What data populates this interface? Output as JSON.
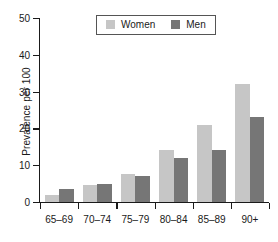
{
  "chart_data": {
    "type": "bar",
    "title": "",
    "subtitle": "",
    "xlabel": "",
    "ylabel": "Prevalence per 100",
    "categories": [
      "65–69",
      "70–74",
      "75–79",
      "80–84",
      "85–89",
      "90+"
    ],
    "series": [
      {
        "name": "Women",
        "color": "#c6c6c6",
        "values": [
          2,
          4.5,
          7.5,
          14,
          21,
          32
        ]
      },
      {
        "name": "Men",
        "color": "#767676",
        "values": [
          3.5,
          5,
          7,
          12,
          14,
          23
        ]
      }
    ],
    "ylim": [
      0,
      50
    ],
    "yticks": [
      0,
      10,
      20,
      30,
      40,
      50
    ],
    "ytick_labels": [
      "0",
      "10",
      "20",
      "30",
      "40",
      "50"
    ],
    "grid": false,
    "legend_position": "top-center",
    "axis_color": "#1a1a1a",
    "background": "#ffffff"
  },
  "legend": {
    "entries": [
      {
        "label": "Women",
        "color": "#c6c6c6"
      },
      {
        "label": "Men",
        "color": "#767676"
      }
    ]
  }
}
